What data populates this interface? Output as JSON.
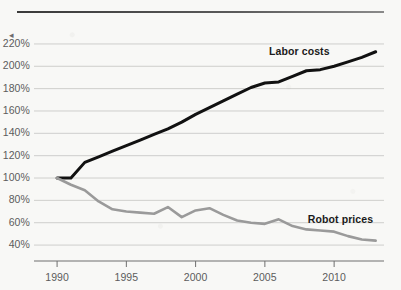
{
  "figure": {
    "background_color": "#f8f8f6",
    "top_rule_color": "#3f3f3f",
    "gridline_color": "#c9c9c7",
    "axis_color": "#6f6f6f"
  },
  "axis_marker": "◂",
  "chart_data": {
    "type": "line",
    "title": "",
    "subtitle": "",
    "xlabel": "",
    "ylabel": "",
    "grid": true,
    "legend_position": "inline-annotation",
    "xlim": [
      1989.2,
      2013.6
    ],
    "ylim": [
      32,
      228
    ],
    "yticks": [
      220,
      200,
      180,
      160,
      140,
      120,
      100,
      80,
      60,
      40
    ],
    "ytick_labels": [
      "220%",
      "200%",
      "180%",
      "160%",
      "140%",
      "120%",
      "100%",
      "80%",
      "60%",
      "40%"
    ],
    "xticks": [
      1990,
      1995,
      2000,
      2005,
      2010
    ],
    "xtick_labels": [
      "1990",
      "1995",
      "2000",
      "2005",
      "2010"
    ],
    "x": [
      1990,
      1991,
      1992,
      1993,
      1994,
      1995,
      1996,
      1997,
      1998,
      1999,
      2000,
      2001,
      2002,
      2003,
      2004,
      2005,
      2006,
      2007,
      2008,
      2009,
      2010,
      2011,
      2012,
      2013
    ],
    "series": [
      {
        "name": "Labor costs",
        "color": "#111111",
        "width": 3.0,
        "label_x": 2005.3,
        "label_y": 213,
        "values": [
          100,
          100,
          114,
          119,
          124,
          129,
          134,
          139,
          144,
          150,
          157,
          163,
          169,
          175,
          181,
          185,
          186,
          191,
          196,
          197,
          200,
          204,
          208,
          213
        ]
      },
      {
        "name": "Robot prices",
        "color": "#9a9a9a",
        "width": 2.6,
        "label_x": 2008.1,
        "label_y": 62,
        "values": [
          100,
          94,
          89,
          79,
          72,
          70,
          69,
          68,
          74,
          65,
          71,
          73,
          67,
          62,
          60,
          59,
          63,
          57,
          54,
          53,
          52,
          48,
          45,
          44
        ]
      }
    ],
    "annotations": [
      {
        "text": "Labor costs",
        "series": "Labor costs"
      },
      {
        "text": "Robot prices",
        "series": "Robot prices"
      }
    ]
  }
}
